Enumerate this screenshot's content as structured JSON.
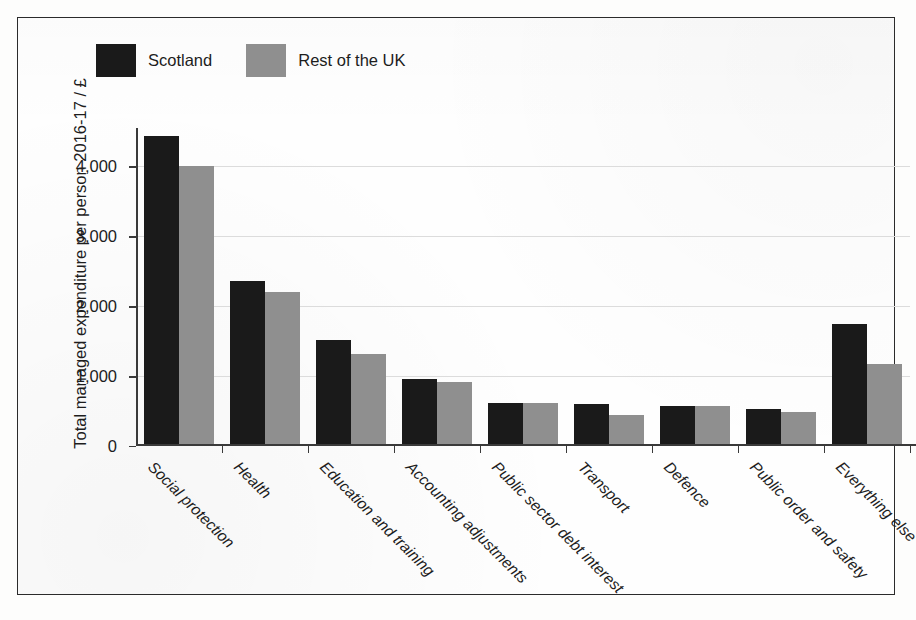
{
  "figure": {
    "y_axis_title": "Total managed expenditure per person 2016-17 / £",
    "bottom_caption": "Fig."
  },
  "legend": {
    "entries": [
      {
        "label": "Scotland",
        "color": "#1a1a1a",
        "swatch_name": "legend-swatch-scotland"
      },
      {
        "label": "Rest of the UK",
        "color": "#8f8f8f",
        "swatch_name": "legend-swatch-rest-of-uk"
      }
    ]
  },
  "chart_data": {
    "type": "bar",
    "title": "",
    "xlabel": "",
    "ylabel": "Total managed expenditure per person 2016-17 / £",
    "ylim": [
      0,
      4550
    ],
    "yticks": [
      0,
      1000,
      2000,
      3000,
      4000
    ],
    "ytick_labels": [
      "0",
      "1,000",
      "2,000",
      "3,000",
      "4,000"
    ],
    "grid": "horizontal",
    "legend_position": "top-left (outside axes)",
    "categories": [
      "Social protection",
      "Health",
      "Education and training",
      "Accounting adjustments",
      "Public sector debt interest",
      "Transport",
      "Defence",
      "Public order and safety",
      "Everything else"
    ],
    "series": [
      {
        "name": "Scotland",
        "color": "#1a1a1a",
        "values": [
          4430,
          2360,
          1520,
          960,
          620,
          600,
          575,
          535,
          1750
        ]
      },
      {
        "name": "Rest of the UK",
        "color": "#8f8f8f",
        "values": [
          4000,
          2200,
          1320,
          920,
          610,
          450,
          575,
          485,
          1180
        ]
      }
    ]
  }
}
